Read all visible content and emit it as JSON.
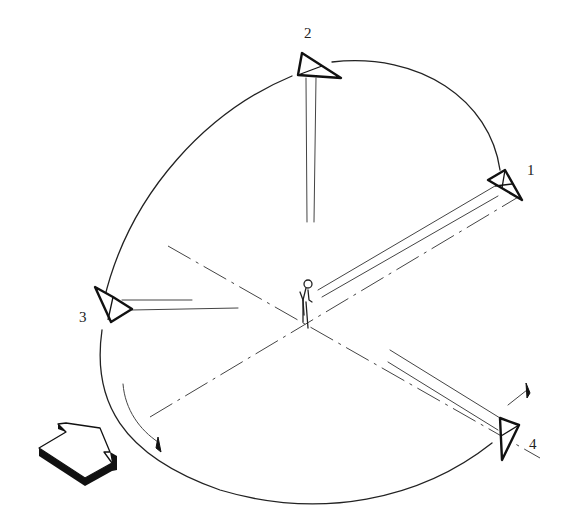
{
  "diagram": {
    "title": "",
    "colors": {
      "ink": "#222222",
      "background": "#ffffff"
    },
    "cameras": [
      {
        "id": "1",
        "label": "1",
        "x": 510,
        "y": 183
      },
      {
        "id": "2",
        "label": "2",
        "x": 314,
        "y": 66
      },
      {
        "id": "3",
        "label": "3",
        "x": 112,
        "y": 305
      },
      {
        "id": "4",
        "label": "4",
        "x": 508,
        "y": 432
      }
    ],
    "center_figure": {
      "name": "walking-person",
      "x": 305,
      "y": 305
    },
    "direction_arrow": {
      "name": "large-3d-arrow",
      "x": 75,
      "y": 450
    },
    "path_arrows": [
      {
        "name": "curved-arrow-left",
        "x": 160,
        "y": 445
      },
      {
        "name": "small-arrow-right",
        "x": 528,
        "y": 388
      }
    ]
  }
}
